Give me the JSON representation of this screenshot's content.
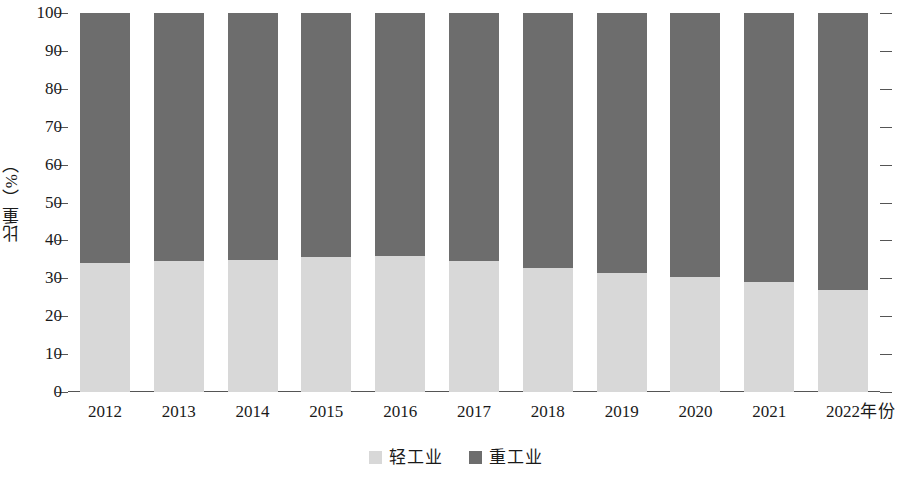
{
  "chart_data": {
    "type": "bar",
    "stacked": true,
    "stack_total": 100,
    "title": "",
    "subtitle": "",
    "xlabel": "年份",
    "ylabel": "比重（%）",
    "categories": [
      "2012",
      "2013",
      "2014",
      "2015",
      "2016",
      "2017",
      "2018",
      "2019",
      "2020",
      "2021",
      "2022"
    ],
    "series": [
      {
        "name": "轻工业",
        "color": "#d8d8d8",
        "values": [
          34.0,
          34.6,
          34.9,
          35.6,
          36.0,
          34.6,
          32.6,
          31.5,
          30.4,
          29.0,
          27.0
        ]
      },
      {
        "name": "重工业",
        "color": "#6d6d6d",
        "values": [
          66.0,
          65.4,
          65.1,
          64.4,
          64.0,
          65.4,
          67.4,
          68.5,
          69.6,
          71.0,
          73.0
        ]
      }
    ],
    "ylim": [
      0,
      100
    ],
    "ytick_values": [
      0,
      10,
      20,
      30,
      40,
      50,
      60,
      70,
      80,
      90,
      100
    ],
    "ytick_labels": [
      "0",
      "10",
      "20",
      "30",
      "40",
      "50",
      "60",
      "70",
      "80",
      "90",
      "100"
    ],
    "grid": false,
    "ticks_both_sides": true,
    "legend_position": "bottom-center",
    "legend_entries": [
      {
        "label": "轻工业",
        "color": "#d8d8d8"
      },
      {
        "label": "重工业",
        "color": "#6d6d6d"
      }
    ]
  },
  "colors": {
    "light_industry": "#d8d8d8",
    "heavy_industry": "#6d6d6d",
    "axis": "#555555",
    "text": "#1a1a1a",
    "background": "#ffffff"
  }
}
